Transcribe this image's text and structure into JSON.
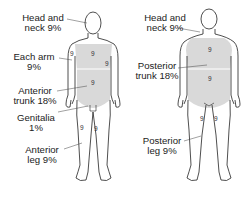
{
  "diagram": {
    "type": "rule-of-nines-body-surface-area",
    "anterior_view": {
      "labels": [
        {
          "line1": "Head and",
          "line2": "neck 9%"
        },
        {
          "line1": "Each arm",
          "line2": "9%"
        },
        {
          "line1": "Anterior",
          "line2": "trunk 18%"
        },
        {
          "line1": "Genitalia",
          "line2": "1%"
        },
        {
          "line1": "Anterior",
          "line2": "leg 9%"
        }
      ],
      "region_numbers": {
        "upper_trunk": "9",
        "lower_trunk": "9",
        "right_arm": "9",
        "left_arm": "9",
        "right_leg": "9",
        "left_leg": "9"
      }
    },
    "posterior_view": {
      "labels": [
        {
          "line1": "Head and",
          "line2": "neck 9%"
        },
        {
          "line1": "Posterior",
          "line2": "trunk 18%"
        },
        {
          "line1": "Posterior",
          "line2": "leg 9%"
        }
      ],
      "region_numbers": {
        "upper_trunk": "9",
        "lower_trunk": "9",
        "right_leg": "9",
        "left_leg": "9"
      }
    },
    "colors": {
      "outline": "#222222",
      "shaded_trunk": "#d9d9d9",
      "text": "#222222"
    }
  }
}
